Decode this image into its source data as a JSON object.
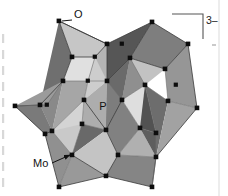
{
  "figure": {
    "kind": "molecular-structure-diagram",
    "background_color": "#ffffff",
    "width": 228,
    "height": 196
  },
  "labels": {
    "oxygen": "O",
    "phosphorus": "P",
    "molybdenum": "Mo",
    "charge": "3–"
  },
  "colors": {
    "ink": "#111111",
    "edge": "#3a3a3a",
    "edge_soft": "#6e6e6e",
    "vertex": "#0d0d0d",
    "bracket": "#555555",
    "face_lightest": "#e2e2e2",
    "face_light": "#c9c9c9",
    "face_mid": "#aaaaaa",
    "face_midtone": "#949494",
    "face_dark": "#7b7b7b",
    "face_darker": "#616161",
    "face_darkest": "#4a4a4a",
    "gutter": "#c4c4c4"
  },
  "annotations": {
    "oxygen_leader": "leader line from O label to upper-left apex vertex",
    "molybdenum_leader": "leader line with arrowhead from Mo label to lower-left polyhedron vertex",
    "phosphorus_position": "central interior label, no leader",
    "bracket_position": "top-right closing square bracket with superscript charge"
  },
  "structure": {
    "description": "alpha-Keggin [PMo12O40] 3- polyhedral representation: twelve MoO6 octahedra surrounding a central PO4 tetrahedron",
    "vertex_count_visible": 33,
    "faces_shaded": true
  },
  "geometry": {
    "vertices": [
      [
        59,
        21
      ],
      [
        152,
        22
      ],
      [
        107,
        44
      ],
      [
        72,
        57
      ],
      [
        188,
        44
      ],
      [
        63,
        81
      ],
      [
        130,
        58
      ],
      [
        165,
        69
      ],
      [
        107,
        81
      ],
      [
        40,
        105
      ],
      [
        15,
        106
      ],
      [
        145,
        85
      ],
      [
        197,
        108
      ],
      [
        168,
        101
      ],
      [
        52,
        131
      ],
      [
        84,
        100
      ],
      [
        82,
        124
      ],
      [
        122,
        100
      ],
      [
        156,
        133
      ],
      [
        45,
        134
      ],
      [
        106,
        130
      ],
      [
        140,
        128
      ],
      [
        72,
        155
      ],
      [
        118,
        155
      ],
      [
        156,
        157
      ],
      [
        59,
        187
      ],
      [
        106,
        176
      ],
      [
        152,
        187
      ],
      [
        95,
        57
      ],
      [
        122,
        44
      ],
      [
        47,
        105
      ],
      [
        176,
        85
      ],
      [
        88,
        81
      ]
    ],
    "faces": [
      {
        "pts": "59,21 72,57 40,105 63,81",
        "tone": "face_darker"
      },
      {
        "pts": "59,21 107,44 95,57 72,57",
        "tone": "face_light"
      },
      {
        "pts": "72,57 95,57 84,100 63,81",
        "tone": "face_lightest"
      },
      {
        "pts": "40,105 63,81 84,100 52,131",
        "tone": "face_mid"
      },
      {
        "pts": "15,106 40,105 52,131 45,134",
        "tone": "face_dark"
      },
      {
        "pts": "15,106 40,105 63,81 47,105",
        "tone": "face_midtone"
      },
      {
        "pts": "107,44 152,22 130,58 107,81",
        "tone": "face_darkest"
      },
      {
        "pts": "107,44 95,57 107,81 88,81",
        "tone": "face_mid"
      },
      {
        "pts": "152,22 188,44 165,69 130,58",
        "tone": "face_dark"
      },
      {
        "pts": "188,44 197,108 168,101 165,69",
        "tone": "face_midtone"
      },
      {
        "pts": "130,58 165,69 145,85 122,100",
        "tone": "face_light"
      },
      {
        "pts": "107,81 130,58 122,100 106,130",
        "tone": "face_darker"
      },
      {
        "pts": "84,100 107,81 106,130 82,124",
        "tone": "face_mid"
      },
      {
        "pts": "52,131 84,100 82,124 72,155",
        "tone": "face_light"
      },
      {
        "pts": "45,134 52,131 72,155 59,187",
        "tone": "face_midtone"
      },
      {
        "pts": "106,130 122,100 140,128 118,155",
        "tone": "face_dark"
      },
      {
        "pts": "122,100 145,85 156,133 140,128",
        "tone": "face_lightest"
      },
      {
        "pts": "145,85 168,101 156,157 156,133",
        "tone": "face_darker"
      },
      {
        "pts": "168,101 197,108 156,157",
        "tone": "face_mid"
      },
      {
        "pts": "72,155 106,130 118,155 106,176",
        "tone": "face_light"
      },
      {
        "pts": "59,187 72,155 106,176",
        "tone": "face_midtone"
      },
      {
        "pts": "106,176 118,155 156,157 152,187",
        "tone": "face_dark"
      },
      {
        "pts": "82,124 106,130 72,155",
        "tone": "face_darkest"
      },
      {
        "pts": "95,57 107,81 84,100 88,81",
        "tone": "face_light"
      },
      {
        "pts": "130,58 145,85 122,100",
        "tone": "face_midtone"
      }
    ]
  },
  "gutter": {
    "present": true,
    "description": "faint cropped column artifacts along the left margin and a thin vertical rule near the right margin",
    "left_marks_y": [
      36,
      52,
      68,
      84,
      100,
      116,
      132,
      148,
      164,
      180
    ],
    "right_rule_x": 219
  }
}
